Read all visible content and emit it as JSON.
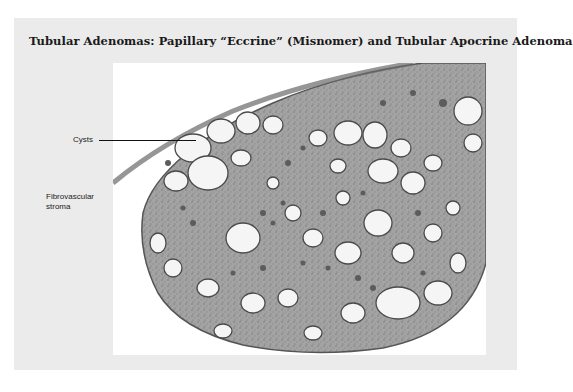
{
  "figure": {
    "title": "Tubular Adenomas: Papillary “Eccrine” (Misnomer) and Tubular Apocrine Adenoma",
    "image_description": "Low-power histology micrograph of a tubular adenoma showing multiple dilated cystic spaces within fibrovascular stroma",
    "annotations": [
      {
        "label": "Cysts",
        "has_leader_line": true
      },
      {
        "label": "Fibrovascular stroma",
        "has_leader_line": false
      }
    ]
  },
  "colors": {
    "panel_background": "#ebebeb",
    "figure_background": "#ffffff",
    "tissue_stroma": "#9a9a9a",
    "tissue_dark": "#5a5a5a",
    "cyst_lumen": "#f4f4f4"
  }
}
